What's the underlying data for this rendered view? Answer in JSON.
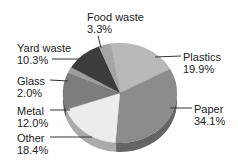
{
  "chart_data": {
    "type": "pie",
    "title": "",
    "categories": [
      "Plastics",
      "Paper",
      "Other",
      "Metal",
      "Glass",
      "Yard waste",
      "Food waste"
    ],
    "values": [
      19.9,
      34.1,
      18.4,
      12.0,
      2.0,
      10.3,
      3.3
    ],
    "value_labels": [
      "19.9%",
      "34.1%",
      "18.4%",
      "12.0%",
      "2.0%",
      "10.3%",
      "3.3%"
    ],
    "colors": [
      "#b9b9b9",
      "#8c8c8c",
      "#ececec",
      "#7d7d7d",
      "#9d9d9d",
      "#3c3c3c",
      "#a5a5a5"
    ],
    "style": "3d tilted pie, grayscale, callout lines",
    "legend": "none (direct labels)"
  },
  "labels": [
    {
      "name": "Food waste",
      "pct": "3.3%",
      "x": 87,
      "y": 11,
      "lx1": 98,
      "ly1": 36,
      "lx2": 101,
      "ly2": 48
    },
    {
      "name": "Plastics",
      "pct": "19.9%",
      "x": 183,
      "y": 51,
      "lx1": 181,
      "ly1": 56,
      "lx2": 155,
      "ly2": 57
    },
    {
      "name": "Paper",
      "pct": "34.1%",
      "x": 194,
      "y": 103,
      "lx1": 192,
      "ly1": 108,
      "lx2": 170,
      "ly2": 108
    },
    {
      "name": "Yard waste",
      "pct": "10.3%",
      "x": 17,
      "y": 42,
      "lx1": 52,
      "ly1": 59,
      "lx2": 86,
      "ly2": 59
    },
    {
      "name": "Glass",
      "pct": "2.0%",
      "x": 17,
      "y": 75,
      "lx1": 50,
      "ly1": 80,
      "lx2": 68,
      "ly2": 81
    },
    {
      "name": "Metal",
      "pct": "12.0%",
      "x": 17,
      "y": 105,
      "lx1": 50,
      "ly1": 110,
      "lx2": 70,
      "ly2": 110
    },
    {
      "name": "Other",
      "pct": "18.4%",
      "x": 17,
      "y": 132,
      "lx1": 50,
      "ly1": 137,
      "lx2": 92,
      "ly2": 137
    }
  ]
}
